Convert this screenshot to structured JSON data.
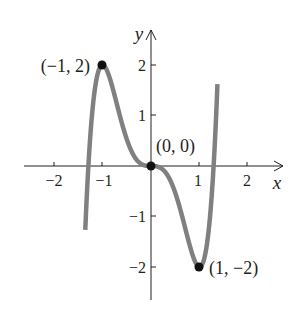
{
  "chart_data": {
    "type": "line",
    "title": "",
    "xlabel": "x",
    "ylabel": "y",
    "function": "y = 3x^5 - 5x^3",
    "xlim": [
      -2.5,
      2.5
    ],
    "ylim": [
      -2.5,
      2.7
    ],
    "x_ticks": [
      -2,
      -1,
      1,
      2
    ],
    "x_tick_labels": [
      "−2",
      "−1",
      "1",
      "2"
    ],
    "y_ticks": [
      -2,
      -1,
      1,
      2
    ],
    "y_tick_labels": [
      "−2",
      "−1",
      "1",
      "2"
    ],
    "grid": false,
    "series": [
      {
        "name": "curve",
        "color": "#808080",
        "x": [
          -1.35,
          -1.29,
          -1.2,
          -1.1,
          -1.0,
          -0.9,
          -0.8,
          -0.6,
          -0.4,
          -0.2,
          0,
          0.2,
          0.4,
          0.6,
          0.8,
          0.9,
          1.0,
          1.1,
          1.2,
          1.29,
          1.37
        ],
        "values": [
          -2.4,
          0,
          1.17,
          1.82,
          2.0,
          1.87,
          1.58,
          0.85,
          0.29,
          0.04,
          0,
          -0.04,
          -0.29,
          -0.85,
          -1.58,
          -1.87,
          -2.0,
          -1.82,
          -1.17,
          0,
          1.97
        ]
      }
    ],
    "annotations": [
      {
        "x": -1,
        "y": 2,
        "text": "(−1, 2)"
      },
      {
        "x": 0,
        "y": 0,
        "text": "(0, 0)"
      },
      {
        "x": 1,
        "y": -2,
        "text": "(1, −2)"
      }
    ]
  },
  "labels": {
    "x_axis": "x",
    "y_axis": "y",
    "xt_m2": "−2",
    "xt_m1": "−1",
    "xt_1": "1",
    "xt_2": "2",
    "yt_2": "2",
    "yt_1": "1",
    "yt_m1": "−1",
    "yt_m2": "−2",
    "pt_max": "(−1, 2)",
    "pt_origin": "(0, 0)",
    "pt_min": "(1, −2)"
  }
}
